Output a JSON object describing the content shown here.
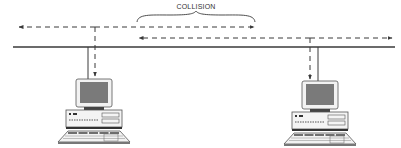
{
  "diagram": {
    "type": "network-collision",
    "annotation": {
      "label": "COLLISION"
    },
    "colors": {
      "line": "#3a3a3a",
      "screen": "#7a7a7a",
      "body": "#f2f2f2",
      "outline": "#555555",
      "background": "#ffffff"
    },
    "bus": {
      "label": ""
    },
    "nodes": [
      {
        "id": "left",
        "name": "Workstation A"
      },
      {
        "id": "right",
        "name": "Workstation B"
      }
    ],
    "signals": [
      {
        "from": "left",
        "direction": "both",
        "description": "Transmission from left workstation"
      },
      {
        "from": "right",
        "direction": "both",
        "description": "Transmission from right workstation"
      }
    ]
  }
}
